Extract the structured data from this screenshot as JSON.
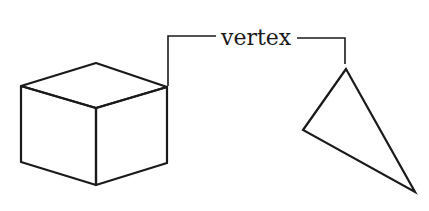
{
  "diagram": {
    "label": "vertex",
    "stroke_color": "#1a1a1a",
    "background": "#ffffff",
    "shapes": [
      {
        "name": "cube",
        "description": "isometric line drawing of a cube"
      },
      {
        "name": "triangle",
        "description": "outline of a tilted triangle"
      }
    ],
    "annotation": "leader line connecting the label 'vertex' to a corner of the cube and the top corner of the triangle"
  }
}
